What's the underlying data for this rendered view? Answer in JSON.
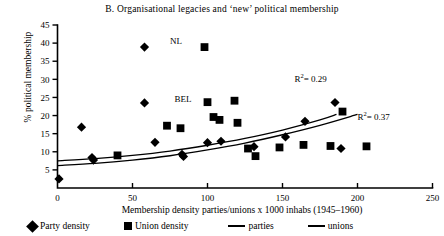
{
  "chart_data": {
    "type": "scatter",
    "title": "B. Organisational legacies and ‘new’ political membership",
    "xlabel": "Membership density parties/unions x 1000 inhabs (1945–1960)",
    "ylabel": "% political membership",
    "xlim": [
      0,
      250
    ],
    "ylim": [
      0,
      45
    ],
    "xticks": [
      0,
      50,
      100,
      150,
      200,
      250
    ],
    "yticks": [
      5,
      10,
      15,
      20,
      25,
      30,
      35,
      40,
      45
    ],
    "grid": false,
    "legend_position": "below-axis",
    "series": [
      {
        "name": "Party density",
        "marker": "diamond",
        "points": [
          {
            "x": 1,
            "y": 2.5
          },
          {
            "x": 16,
            "y": 16.8
          },
          {
            "x": 23,
            "y": 8.4
          },
          {
            "x": 24,
            "y": 7.7
          },
          {
            "x": 58,
            "y": 38.9
          },
          {
            "x": 58,
            "y": 23.5
          },
          {
            "x": 65,
            "y": 12.6
          },
          {
            "x": 83,
            "y": 9.3
          },
          {
            "x": 84,
            "y": 8.7
          },
          {
            "x": 100,
            "y": 12.5
          },
          {
            "x": 109,
            "y": 12.9
          },
          {
            "x": 131,
            "y": 11.4
          },
          {
            "x": 152,
            "y": 14.1
          },
          {
            "x": 165,
            "y": 18.4
          },
          {
            "x": 185,
            "y": 23.6
          },
          {
            "x": 189,
            "y": 10.9
          }
        ]
      },
      {
        "name": "Union density",
        "marker": "square",
        "points": [
          {
            "x": 40,
            "y": 9.0
          },
          {
            "x": 73,
            "y": 17.2
          },
          {
            "x": 82,
            "y": 16.5
          },
          {
            "x": 98,
            "y": 38.9
          },
          {
            "x": 100,
            "y": 23.7
          },
          {
            "x": 104,
            "y": 19.6
          },
          {
            "x": 108,
            "y": 18.8
          },
          {
            "x": 118,
            "y": 24.1
          },
          {
            "x": 120,
            "y": 18.0
          },
          {
            "x": 127,
            "y": 10.9
          },
          {
            "x": 132,
            "y": 8.8
          },
          {
            "x": 148,
            "y": 11.2
          },
          {
            "x": 164,
            "y": 11.9
          },
          {
            "x": 182,
            "y": 11.6
          },
          {
            "x": 190,
            "y": 21.1
          },
          {
            "x": 206,
            "y": 11.5
          }
        ]
      }
    ],
    "fits": [
      {
        "name": "parties",
        "label": "R²= 0.29",
        "curve": [
          {
            "x": 0,
            "y": 7.5
          },
          {
            "x": 25,
            "y": 8.1
          },
          {
            "x": 50,
            "y": 9.0
          },
          {
            "x": 75,
            "y": 10.2
          },
          {
            "x": 100,
            "y": 11.8
          },
          {
            "x": 125,
            "y": 13.7
          },
          {
            "x": 150,
            "y": 16.0
          },
          {
            "x": 175,
            "y": 18.8
          },
          {
            "x": 186,
            "y": 20.3
          }
        ]
      },
      {
        "name": "unions",
        "label": "R²= 0.37",
        "curve": [
          {
            "x": 0,
            "y": 6.2
          },
          {
            "x": 25,
            "y": 6.8
          },
          {
            "x": 50,
            "y": 7.7
          },
          {
            "x": 75,
            "y": 8.9
          },
          {
            "x": 100,
            "y": 10.5
          },
          {
            "x": 125,
            "y": 12.4
          },
          {
            "x": 150,
            "y": 14.7
          },
          {
            "x": 175,
            "y": 17.3
          },
          {
            "x": 200,
            "y": 20.3
          }
        ]
      }
    ],
    "point_labels": [
      {
        "text": "NL",
        "x": 75,
        "y": 40.2
      },
      {
        "text": "BEL",
        "x": 78,
        "y": 24.2
      }
    ],
    "annotations": [
      {
        "text": "R²= 0.29",
        "base": "R",
        "sup": "2",
        "rest": "= 0.29",
        "x": 158,
        "y": 30.5
      },
      {
        "text": "R²= 0.37",
        "base": "R",
        "sup": "2",
        "rest": "= 0.37",
        "x": 200,
        "y": 20.0
      }
    ]
  },
  "legend": {
    "party_density": "Party density",
    "union_density": "Union density",
    "parties": "parties",
    "unions": "unions"
  },
  "axis_text": {
    "y0": "0",
    "y5": "5",
    "y10": "10",
    "y15": "15",
    "y20": "20",
    "y25": "25",
    "y30": "30",
    "y35": "35",
    "y40": "40",
    "y45": "45",
    "x0": "0",
    "x50": "50",
    "x100": "100",
    "x150": "150",
    "x200": "200",
    "x250": "250"
  },
  "colors": {
    "ink": "#000000",
    "background": "#ffffff"
  }
}
